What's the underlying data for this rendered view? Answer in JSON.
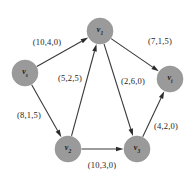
{
  "diagram": {
    "type": "directed-graph",
    "title": "",
    "width": 191,
    "height": 175,
    "background_color": "#ffffff",
    "node_fill_color": "#9a9a9a",
    "edge_color": "#3a3a3a",
    "label_color": "#1c1c1c",
    "edge_label_format": "(capacity,cost,flow)",
    "nodes": [
      {
        "id": "v1",
        "label_base": "v",
        "label_sub": "1",
        "x": 100,
        "y": 31,
        "r": 13
      },
      {
        "id": "vs",
        "label_base": "v",
        "label_sub": "s",
        "x": 25,
        "y": 73,
        "r": 13
      },
      {
        "id": "vt",
        "label_base": "v",
        "label_sub": "t",
        "x": 170,
        "y": 79,
        "r": 13
      },
      {
        "id": "v2",
        "label_base": "v",
        "label_sub": "2",
        "x": 68,
        "y": 149,
        "r": 13
      },
      {
        "id": "v3",
        "label_base": "v",
        "label_sub": "3",
        "x": 137,
        "y": 149,
        "r": 13
      }
    ],
    "edges": [
      {
        "id": "e-vs-v1",
        "from": "vs",
        "to": "v1",
        "label": "(10,4,0)",
        "label_x": 47,
        "label_y": 42
      },
      {
        "id": "e-vs-v2",
        "from": "vs",
        "to": "v2",
        "label": "(8,1,5)",
        "label_x": 29,
        "label_y": 115
      },
      {
        "id": "e-v2-v1",
        "from": "v2",
        "to": "v1",
        "label": "(5,2,5)",
        "label_x": 70,
        "label_y": 78
      },
      {
        "id": "e-v2-v3",
        "from": "v2",
        "to": "v3",
        "label": "(10,3,0)",
        "label_x": 102,
        "label_y": 165
      },
      {
        "id": "e-v1-v3",
        "from": "v1",
        "to": "v3",
        "label": "(2,6,0)",
        "label_x": 133,
        "label_y": 81
      },
      {
        "id": "e-v1-vt",
        "from": "v1",
        "to": "vt",
        "label": "(7,1,5)",
        "label_x": 160,
        "label_y": 41
      },
      {
        "id": "e-v3-vt",
        "from": "v3",
        "to": "vt",
        "label": "(4,2,0)",
        "label_x": 166,
        "label_y": 126
      }
    ]
  }
}
